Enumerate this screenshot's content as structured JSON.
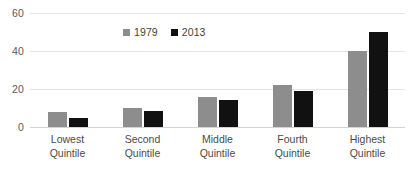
{
  "chart_data": {
    "type": "bar",
    "title": "",
    "xlabel": "",
    "ylabel": "",
    "ylim": [
      0,
      60
    ],
    "yticks": [
      0,
      20,
      40,
      60
    ],
    "grid": true,
    "legend_position": "top-center",
    "categories": [
      "Lowest Quintile",
      "Second Quintile",
      "Middle Quintile",
      "Fourth Quintile",
      "Highest Quintile"
    ],
    "category_lines": [
      [
        "Lowest",
        "Quintile"
      ],
      [
        "Second",
        "Quintile"
      ],
      [
        "Middle",
        "Quintile"
      ],
      [
        "Fourth",
        "Quintile"
      ],
      [
        "Highest",
        "Quintile"
      ]
    ],
    "series": [
      {
        "name": "1979",
        "color": "#8d8d8d",
        "values": [
          8,
          10,
          16,
          22,
          40
        ]
      },
      {
        "name": "2013",
        "color": "#111111",
        "values": [
          5,
          8.5,
          14,
          19,
          50
        ]
      }
    ]
  }
}
